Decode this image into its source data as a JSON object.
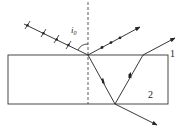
{
  "diagram": {
    "labels": {
      "angle": "i",
      "angle_sub": "0",
      "ray1": "1",
      "ray2": "2"
    },
    "colors": {
      "line": "#222222",
      "background": "#ffffff"
    },
    "elements": {
      "slab": {
        "x": 8,
        "y": 55,
        "width": 160,
        "height": 49
      },
      "normal": {
        "x": 88,
        "y1": 0,
        "y2": 104
      },
      "incident_ray": {
        "from": [
          24,
          24
        ],
        "to": [
          88,
          55
        ],
        "polarization": "mixed (dots and dashes)"
      },
      "reflected_ray": {
        "from": [
          88,
          55
        ],
        "to": [
          140,
          27
        ],
        "polarization": "s (dots)"
      },
      "refracted_ray": {
        "from": [
          88,
          55
        ],
        "to": [
          115,
          104
        ]
      },
      "internal_reflected_ray": {
        "from": [
          115,
          104
        ],
        "to": [
          143,
          55
        ]
      },
      "transmitted_bottom_ray": {
        "from": [
          115,
          104
        ],
        "to": [
          157,
          125
        ]
      },
      "exit_top_ray": {
        "from": [
          143,
          55
        ],
        "to": [
          175,
          38
        ]
      }
    }
  }
}
